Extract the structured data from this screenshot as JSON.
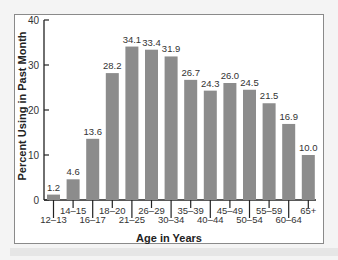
{
  "chart_data": {
    "type": "bar",
    "title": "",
    "xlabel": "Age in Years",
    "ylabel": "Percent Using in Past Month",
    "ylim": [
      0,
      40
    ],
    "yticks": [
      0,
      10,
      20,
      30,
      40
    ],
    "grid": false,
    "categories": [
      "12–13",
      "14–15",
      "16–17",
      "18–20",
      "21–25",
      "26–29",
      "30–34",
      "35–39",
      "40–44",
      "45–49",
      "50–54",
      "55–59",
      "60–64",
      "65+"
    ],
    "values": [
      1.2,
      4.6,
      13.6,
      28.2,
      34.1,
      33.4,
      31.9,
      26.7,
      24.3,
      26.0,
      24.5,
      21.5,
      16.9,
      10.0
    ],
    "value_labels": [
      "1.2",
      "4.6",
      "13.6",
      "28.2",
      "34.1",
      "33.4",
      "31.9",
      "26.7",
      "24.3",
      "26.0",
      "24.5",
      "21.5",
      "16.9",
      "10.0"
    ],
    "bar_color": "#8c8c8c"
  }
}
